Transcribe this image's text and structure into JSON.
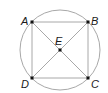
{
  "diagram": {
    "colors": {
      "circle": "#a8a8a8",
      "lines": "#a8a8a8",
      "points": "#111111",
      "labels": "#1a1a1a"
    },
    "circle": {
      "cx": 60,
      "cy": 50,
      "r": 40
    },
    "points": {
      "A": {
        "label": "A",
        "x": 32,
        "y": 22
      },
      "B": {
        "label": "B",
        "x": 88,
        "y": 22
      },
      "C": {
        "label": "C",
        "x": 88,
        "y": 78
      },
      "D": {
        "label": "D",
        "x": 32,
        "y": 78
      },
      "E": {
        "label": "E",
        "x": 60,
        "y": 50
      }
    },
    "segments": [
      [
        "A",
        "B"
      ],
      [
        "B",
        "C"
      ],
      [
        "C",
        "D"
      ],
      [
        "D",
        "A"
      ],
      [
        "A",
        "C"
      ],
      [
        "B",
        "D"
      ]
    ]
  }
}
